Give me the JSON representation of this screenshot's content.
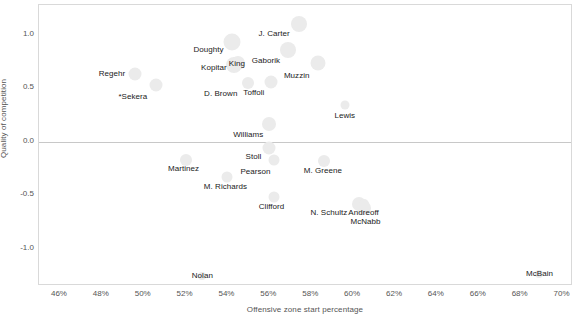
{
  "chart_data": {
    "type": "scatter",
    "title": "",
    "xlabel": "Offensive zone start percentage",
    "ylabel": "Quality of competition",
    "xlim": [
      45.0,
      70.5
    ],
    "ylim": [
      -1.35,
      1.28
    ],
    "grid": false,
    "legend": null,
    "bubble_size_encoding": "time on ice (relative marker area)",
    "x_ticks": [
      "46%",
      "48%",
      "50%",
      "52%",
      "54%",
      "56%",
      "58%",
      "60%",
      "62%",
      "64%",
      "66%",
      "68%",
      "70%"
    ],
    "x_tick_values": [
      46,
      48,
      50,
      52,
      54,
      56,
      58,
      60,
      62,
      64,
      66,
      68,
      70
    ],
    "y_ticks": [
      "1.0",
      "0.5",
      "0.0",
      "-0.5",
      "-1.0"
    ],
    "y_tick_values": [
      1.0,
      0.5,
      0.0,
      -0.5,
      -1.0
    ],
    "reference_lines": [
      {
        "axis": "y",
        "value": 0.0,
        "color": "#c8c8c8"
      }
    ],
    "points": [
      {
        "label": "Regehr",
        "x": 49.6,
        "y": 0.63,
        "size": 13,
        "label_dx": -10,
        "label_dy": 0,
        "anchor": "end"
      },
      {
        "label": "*Sekera",
        "x": 50.6,
        "y": 0.53,
        "size": 13,
        "label_dx": -9,
        "label_dy": 12,
        "anchor": "end"
      },
      {
        "label": "Doughty",
        "x": 54.2,
        "y": 0.93,
        "size": 17,
        "label_dx": -8,
        "label_dy": 8,
        "anchor": "end"
      },
      {
        "label": "Kopitar",
        "x": 54.3,
        "y": 0.72,
        "size": 16,
        "label_dx": -7,
        "label_dy": 3,
        "anchor": "end"
      },
      {
        "label": "King",
        "x": 54.5,
        "y": 0.74,
        "size": 14,
        "label_dx": -1,
        "label_dy": 1,
        "anchor": "mid"
      },
      {
        "label": "J. Carter",
        "x": 57.4,
        "y": 1.1,
        "size": 16,
        "label_dx": -9,
        "label_dy": 10,
        "anchor": "end"
      },
      {
        "label": "Gaborik",
        "x": 56.9,
        "y": 0.86,
        "size": 16,
        "label_dx": -8,
        "label_dy": 11,
        "anchor": "end"
      },
      {
        "label": "Muzzin",
        "x": 58.3,
        "y": 0.74,
        "size": 15,
        "label_dx": -8,
        "label_dy": 13,
        "anchor": "end"
      },
      {
        "label": "D. Brown",
        "x": 55.0,
        "y": 0.55,
        "size": 12,
        "label_dx": -11,
        "label_dy": 11,
        "anchor": "end"
      },
      {
        "label": "Toffoli",
        "x": 56.1,
        "y": 0.56,
        "size": 13,
        "label_dx": -7,
        "label_dy": 11,
        "anchor": "end"
      },
      {
        "label": "Lewis",
        "x": 59.6,
        "y": 0.34,
        "size": 9,
        "label_dx": 0,
        "label_dy": 11,
        "anchor": "mid"
      },
      {
        "label": "Williams",
        "x": 56.0,
        "y": 0.17,
        "size": 14,
        "label_dx": -6,
        "label_dy": 11,
        "anchor": "end"
      },
      {
        "label": "Stoll",
        "x": 56.0,
        "y": -0.06,
        "size": 13,
        "label_dx": -8,
        "label_dy": 9,
        "anchor": "end"
      },
      {
        "label": "Pearson",
        "x": 56.2,
        "y": -0.17,
        "size": 11,
        "label_dx": -3,
        "label_dy": 12,
        "anchor": "end"
      },
      {
        "label": "Martinez",
        "x": 52.0,
        "y": -0.17,
        "size": 12,
        "label_dx": -2,
        "label_dy": 9,
        "anchor": "mid"
      },
      {
        "label": "M. Greene",
        "x": 58.6,
        "y": -0.18,
        "size": 12,
        "label_dx": -1,
        "label_dy": 10,
        "anchor": "mid"
      },
      {
        "label": "M. Richards",
        "x": 54.0,
        "y": -0.33,
        "size": 11,
        "label_dx": -2,
        "label_dy": 10,
        "anchor": "mid"
      },
      {
        "label": "Clifford",
        "x": 56.2,
        "y": -0.52,
        "size": 11,
        "label_dx": -2,
        "label_dy": 10,
        "anchor": "mid"
      },
      {
        "label": "N. Schultz",
        "x": 60.3,
        "y": -0.58,
        "size": 14,
        "label_dx": -12,
        "label_dy": 9,
        "anchor": "end"
      },
      {
        "label": "Andreoff",
        "x": 60.5,
        "y": -0.58,
        "size": 10,
        "label_dx": 0,
        "label_dy": 9,
        "anchor": "mid"
      },
      {
        "label": "McNabb",
        "x": 60.5,
        "y": -0.62,
        "size": 14,
        "label_dx": 2,
        "label_dy": 14,
        "anchor": "mid"
      },
      {
        "label": "Nolan",
        "x": 52.8,
        "y": -1.26,
        "size": 8,
        "label_dx": 0,
        "label_dy": 0,
        "anchor": "mid"
      },
      {
        "label": "McBain",
        "x": 68.9,
        "y": -1.24,
        "size": 8,
        "label_dx": 0,
        "label_dy": 0,
        "anchor": "mid"
      }
    ]
  },
  "colors": {
    "bubble_fill": "#ebebeb",
    "axis_text": "#555555",
    "label_text": "#1a1a1a",
    "frame_border": "#d9d9d9",
    "zero_line": "#c8c8c8",
    "background": "#ffffff"
  }
}
